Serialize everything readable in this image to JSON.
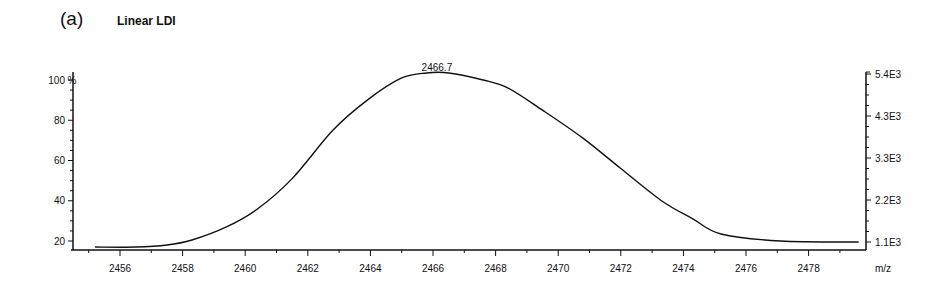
{
  "panel_label": "(a)",
  "title": "Linear LDI",
  "chart_data": {
    "type": "line",
    "title": "Linear LDI",
    "panel": "(a)",
    "xlabel": "m/z",
    "ylabel_left": "%",
    "ylabel_right": "",
    "x_ticks": [
      "2456",
      "2458",
      "2460",
      "2462",
      "2464",
      "2466",
      "2468",
      "2470",
      "2472",
      "2474",
      "2476",
      "2478"
    ],
    "y_left_ticks": [
      "20",
      "40",
      "60",
      "80",
      "100"
    ],
    "y_right_ticks": [
      "1.1E3",
      "2.2E3",
      "3.3E3",
      "4.3E3",
      "5.4E3"
    ],
    "xlim": [
      2454.8,
      2479.8
    ],
    "ylim_left": [
      16,
      100
    ],
    "ylim_right": [
      850,
      5400
    ],
    "peak_annotation": {
      "x": 2466.7,
      "label": "2466.7"
    },
    "grid": false,
    "legend": "none",
    "series": [
      {
        "name": "Linear LDI spectrum",
        "x": [
          2455.2,
          2456.5,
          2457.5,
          2458.3,
          2459.4,
          2460.4,
          2461.5,
          2462.8,
          2463.9,
          2465.0,
          2465.8,
          2466.5,
          2467.6,
          2468.4,
          2469.5,
          2470.8,
          2472.0,
          2473.3,
          2474.3,
          2475.2,
          2477.1,
          2479.6
        ],
        "y": [
          17,
          17,
          18,
          20.5,
          27,
          36,
          51,
          75,
          90,
          101,
          103.5,
          103.5,
          100,
          96,
          85,
          71,
          56,
          40,
          31,
          23.5,
          20,
          19.5
        ]
      }
    ]
  }
}
